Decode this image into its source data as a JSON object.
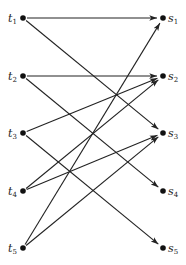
{
  "diagram": {
    "type": "bipartite-directed-graph",
    "left_nodes": [
      {
        "id": "t1",
        "base": "t",
        "sub": "1",
        "x": 23,
        "y": 18
      },
      {
        "id": "t2",
        "base": "t",
        "sub": "2",
        "x": 23,
        "y": 76
      },
      {
        "id": "t3",
        "base": "t",
        "sub": "3",
        "x": 23,
        "y": 133
      },
      {
        "id": "t4",
        "base": "t",
        "sub": "4",
        "x": 23,
        "y": 191
      },
      {
        "id": "t5",
        "base": "t",
        "sub": "5",
        "x": 23,
        "y": 248
      }
    ],
    "right_nodes": [
      {
        "id": "s1",
        "base": "s",
        "sub": "1",
        "x": 163,
        "y": 18
      },
      {
        "id": "s2",
        "base": "s",
        "sub": "2",
        "x": 163,
        "y": 76
      },
      {
        "id": "s3",
        "base": "s",
        "sub": "3",
        "x": 163,
        "y": 133
      },
      {
        "id": "s4",
        "base": "s",
        "sub": "4",
        "x": 163,
        "y": 191
      },
      {
        "id": "s5",
        "base": "s",
        "sub": "5",
        "x": 163,
        "y": 248
      }
    ],
    "edges": [
      {
        "from": "t1",
        "to": "s1"
      },
      {
        "from": "t1",
        "to": "s3"
      },
      {
        "from": "t2",
        "to": "s2"
      },
      {
        "from": "t2",
        "to": "s4"
      },
      {
        "from": "t3",
        "to": "s2"
      },
      {
        "from": "t3",
        "to": "s5"
      },
      {
        "from": "t4",
        "to": "s2"
      },
      {
        "from": "t4",
        "to": "s3"
      },
      {
        "from": "t5",
        "to": "s1"
      },
      {
        "from": "t5",
        "to": "s3"
      }
    ]
  }
}
